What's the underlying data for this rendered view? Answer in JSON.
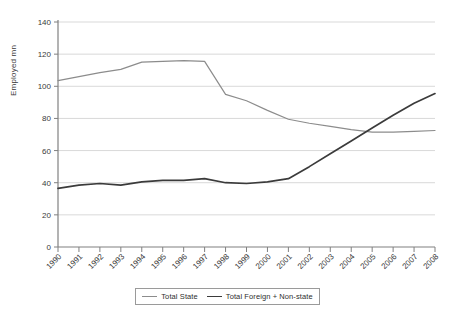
{
  "chart_data": {
    "type": "line",
    "title": "",
    "subtitle": "",
    "xlabel": "",
    "ylabel": "Employed mn",
    "ylim": [
      0,
      140
    ],
    "ytick_step": 20,
    "yticks": [
      0,
      20,
      40,
      60,
      80,
      100,
      120,
      140
    ],
    "grid": true,
    "grid_axis": "y",
    "legend_position": "bottom",
    "categories": [
      "1990",
      "1991",
      "1992",
      "1993",
      "1994",
      "1995",
      "1996",
      "1997",
      "1998",
      "1999",
      "2000",
      "2001",
      "2002",
      "2003",
      "2004",
      "2005",
      "2006",
      "2007",
      "2008"
    ],
    "series": [
      {
        "name": "Total State",
        "color": "#8c8c8c",
        "values": [
          103.5,
          106,
          108.5,
          110.5,
          115,
          115.5,
          116,
          115.5,
          95,
          91,
          85,
          79.5,
          77,
          75,
          73,
          71.5,
          71.5,
          72,
          72.5
        ]
      },
      {
        "name": "Total Foreign + Non-state",
        "color": "#3b3b3b",
        "values": [
          36.5,
          38.5,
          39.5,
          38.5,
          40.5,
          41.5,
          41.5,
          42.5,
          40,
          39.5,
          40.5,
          42.5,
          50,
          58,
          66,
          74,
          82,
          89.5,
          95.5
        ]
      }
    ]
  },
  "axes": {
    "y_title": "Employed mn",
    "y_ticks": [
      "0",
      "20",
      "40",
      "60",
      "80",
      "100",
      "120",
      "140"
    ],
    "x_ticks": [
      "1990",
      "1991",
      "1992",
      "1993",
      "1994",
      "1995",
      "1996",
      "1997",
      "1998",
      "1999",
      "2000",
      "2001",
      "2002",
      "2003",
      "2004",
      "2005",
      "2006",
      "2007",
      "2008"
    ]
  },
  "legend": {
    "items": [
      {
        "label": "Total State",
        "color": "#8c8c8c"
      },
      {
        "label": "Total Foreign + Non-state",
        "color": "#3b3b3b"
      }
    ]
  },
  "colors": {
    "state_line": "#8c8c8c",
    "nonstate_line": "#3b3b3b",
    "gridline": "#d9d9d9",
    "axis": "#808080",
    "text": "#3a3a3a",
    "background": "#ffffff"
  }
}
